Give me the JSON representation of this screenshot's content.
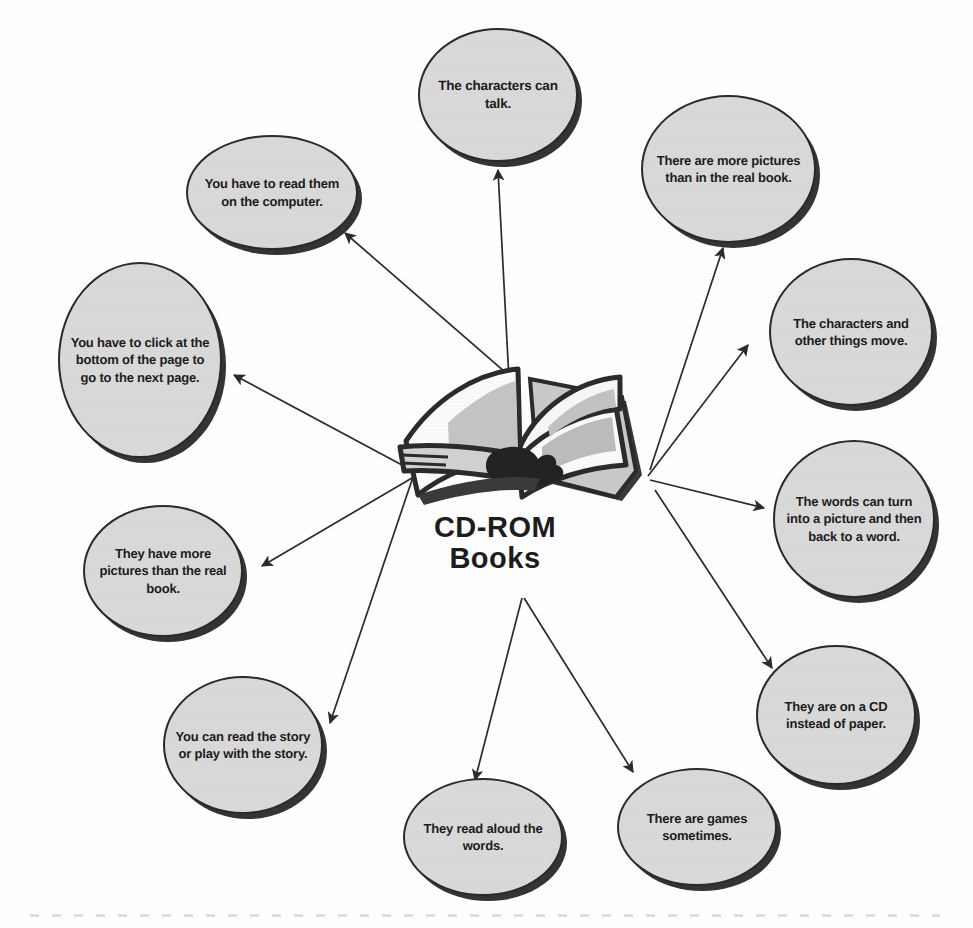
{
  "diagram": {
    "title": "CD-ROM Books",
    "center": {
      "label": "CD-ROM\nBooks",
      "icon": "open-book-illustration"
    },
    "style": {
      "bubble_fill": "#d9d9d9",
      "bubble_border": "#2a2a2a",
      "bubble_shadow": "#343434",
      "text_color": "#1c1c1c",
      "background": "#ffffff",
      "arrow_color": "#2b2b2b"
    },
    "nodes": [
      {
        "id": "characters-can-talk",
        "text": "The characters can talk.",
        "x": 418,
        "y": 28,
        "w": 160,
        "h": 134,
        "font": 13.5
      },
      {
        "id": "more-pictures-than-real-book",
        "text": "There are more pictures than in the real book.",
        "x": 641,
        "y": 95,
        "w": 175,
        "h": 148,
        "font": 13
      },
      {
        "id": "read-them-on-computer",
        "text": "You have to read them on the computer.",
        "x": 186,
        "y": 135,
        "w": 172,
        "h": 115,
        "font": 13
      },
      {
        "id": "characters-and-things-move",
        "text": "The characters and other things move.",
        "x": 769,
        "y": 258,
        "w": 164,
        "h": 148,
        "font": 13
      },
      {
        "id": "click-bottom-of-page",
        "text": "You have to click at the bottom of the page to go to the next page.",
        "x": 58,
        "y": 262,
        "w": 164,
        "h": 196,
        "font": 13
      },
      {
        "id": "words-turn-into-picture",
        "text": "The words can turn into a picture and then back to a word.",
        "x": 773,
        "y": 440,
        "w": 162,
        "h": 158,
        "font": 13
      },
      {
        "id": "they-have-more-pictures",
        "text": "They have more pictures than the real book.",
        "x": 83,
        "y": 505,
        "w": 160,
        "h": 132,
        "font": 13
      },
      {
        "id": "on-a-cd-instead-of-paper",
        "text": "They are on a CD instead of paper.",
        "x": 756,
        "y": 645,
        "w": 160,
        "h": 140,
        "font": 13
      },
      {
        "id": "read-or-play-with-story",
        "text": "You can read the story or play with the story.",
        "x": 163,
        "y": 676,
        "w": 160,
        "h": 138,
        "font": 13
      },
      {
        "id": "read-aloud-the-words",
        "text": "They read aloud the words.",
        "x": 403,
        "y": 778,
        "w": 160,
        "h": 118,
        "font": 13
      },
      {
        "id": "games-sometimes",
        "text": "There are games sometimes.",
        "x": 617,
        "y": 768,
        "w": 160,
        "h": 118,
        "font": 13
      }
    ],
    "arrows": [
      {
        "id": "to-characters-can-talk",
        "x1": 509,
        "y1": 380,
        "x2": 498,
        "y2": 170
      },
      {
        "id": "to-more-pictures-than-real-book",
        "x1": 650,
        "y1": 470,
        "x2": 723,
        "y2": 248
      },
      {
        "id": "to-read-them-on-computer",
        "x1": 512,
        "y1": 378,
        "x2": 345,
        "y2": 233
      },
      {
        "id": "to-characters-and-things-move",
        "x1": 648,
        "y1": 476,
        "x2": 748,
        "y2": 345
      },
      {
        "id": "to-click-bottom-of-page",
        "x1": 430,
        "y1": 480,
        "x2": 234,
        "y2": 375
      },
      {
        "id": "to-words-turn-into-picture",
        "x1": 650,
        "y1": 480,
        "x2": 764,
        "y2": 508
      },
      {
        "id": "to-they-have-more-pictures",
        "x1": 412,
        "y1": 478,
        "x2": 262,
        "y2": 566
      },
      {
        "id": "to-on-a-cd-instead-of-paper",
        "x1": 655,
        "y1": 490,
        "x2": 772,
        "y2": 668
      },
      {
        "id": "to-read-or-play-with-story",
        "x1": 414,
        "y1": 474,
        "x2": 330,
        "y2": 723
      },
      {
        "id": "to-read-aloud-the-words",
        "x1": 522,
        "y1": 598,
        "x2": 475,
        "y2": 780
      },
      {
        "id": "to-games-sometimes",
        "x1": 524,
        "y1": 598,
        "x2": 633,
        "y2": 772
      }
    ]
  }
}
